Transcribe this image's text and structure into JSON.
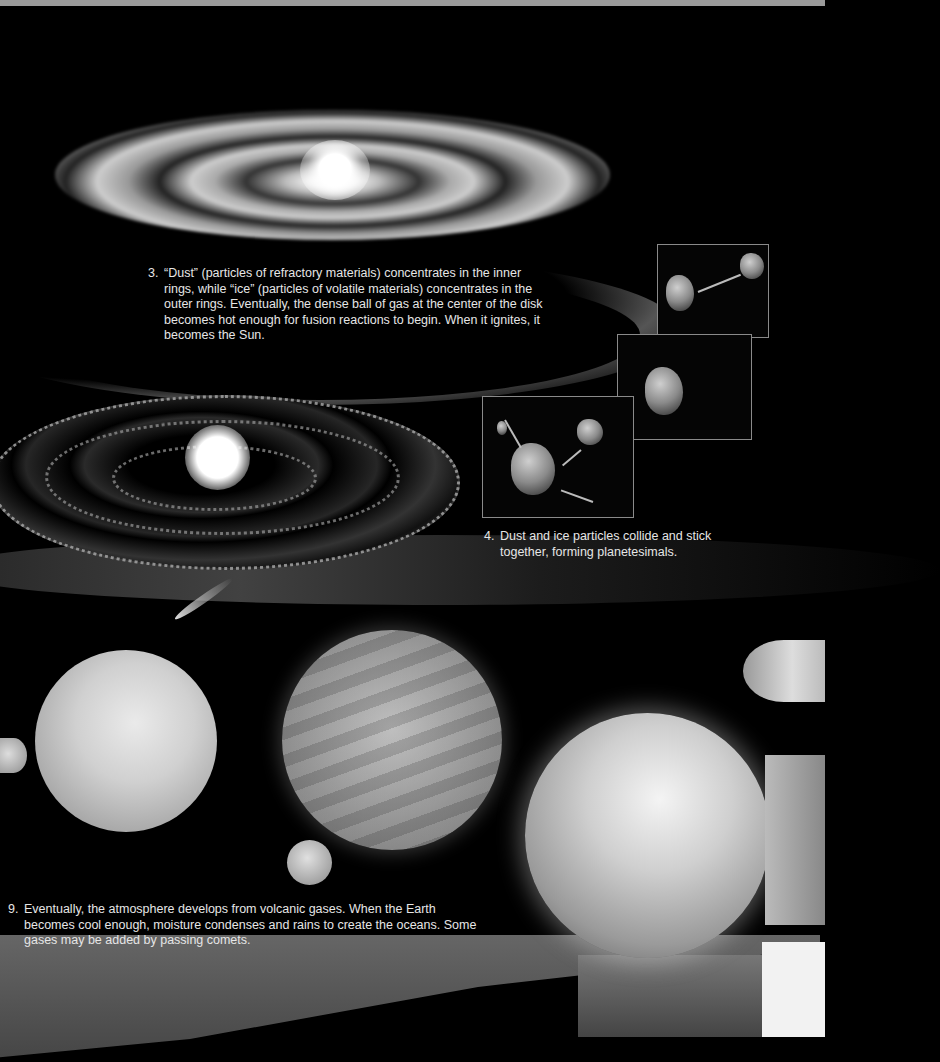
{
  "captions": {
    "step3": {
      "number": "3.",
      "text": "“Dust” (particles of refractory materials) concentrates in the inner rings, while “ice” (particles of volatile materials) concentrates in the outer rings. Eventually, the dense ball of gas at the center of the disk becomes hot enough for fusion reactions to begin. When it ignites, it becomes the Sun."
    },
    "step4": {
      "number": "4.",
      "text": "Dust and ice particles collide and stick together, forming planetesimals."
    },
    "step9": {
      "number": "9.",
      "text": "Eventually, the atmosphere develops from volcanic gases. When the Earth becomes cool enough, moisture condenses and rains to create the oceans. Some gases may be added by passing comets."
    }
  },
  "illustrations": {
    "disk_top": "protoplanetary-disk-with-dust-rings",
    "disk_middle": "young-sun-with-planetesimal-rings",
    "insets": [
      "planetesimal-collision-1",
      "planetesimal-collision-2",
      "planetesimal-collision-3"
    ],
    "planets": [
      "cratered-protoplanet",
      "cloud-covered-protoplanet",
      "small-moon-left",
      "small-moon-center",
      "distant-planet-right",
      "earth-with-oceans-and-clouds"
    ],
    "comet": "passing-comet"
  }
}
